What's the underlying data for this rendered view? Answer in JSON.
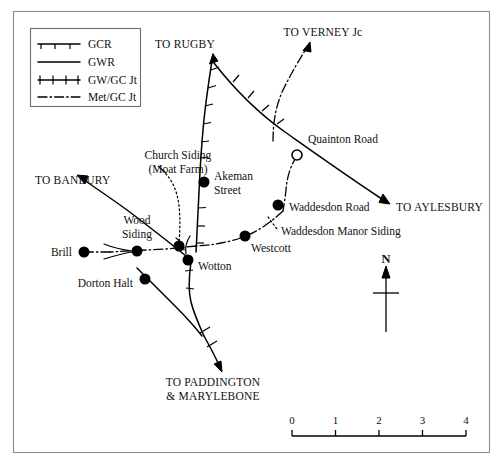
{
  "figure": {
    "kind": "railway-route-map",
    "region": "Brill Tramway / Great Central & Metropolitan lines, Buckinghamshire"
  },
  "legend": {
    "title": "",
    "items": [
      {
        "key": "gcr",
        "label": "GCR",
        "style": "solid-with-down-ticks"
      },
      {
        "key": "gwr",
        "label": "GWR",
        "style": "solid"
      },
      {
        "key": "gwgc",
        "label": "GW/GC Jt",
        "style": "solid-with-cross-ticks"
      },
      {
        "key": "metgc",
        "label": "Met/GC Jt",
        "style": "dash-dot"
      }
    ]
  },
  "destinations": [
    {
      "key": "rugby",
      "label": "TO RUGBY"
    },
    {
      "key": "verney",
      "label": "TO VERNEY Jc"
    },
    {
      "key": "aylesbury",
      "label": "TO AYLESBURY"
    },
    {
      "key": "banbury",
      "label": "TO BANBURY"
    },
    {
      "key": "paddington",
      "label_line1": "TO PADDINGTON",
      "label_line2": "& MARYLEBONE"
    }
  ],
  "stations": [
    {
      "key": "quainton",
      "label": "Quainton Road",
      "marker": "open-circle"
    },
    {
      "key": "akeman",
      "label_line1": "Akeman",
      "label_line2": "Street",
      "marker": "filled-circle"
    },
    {
      "key": "waddesdon_road",
      "label": "Waddesdon Road",
      "marker": "filled-circle"
    },
    {
      "key": "waddesdon_manor",
      "label": "Waddesdon Manor Siding",
      "marker": "none"
    },
    {
      "key": "westcott",
      "label": "Westcott",
      "marker": "filled-circle"
    },
    {
      "key": "wotton",
      "label": "Wotton",
      "marker": "filled-circle"
    },
    {
      "key": "wood_siding",
      "label_line1": "Wood",
      "label_line2": "Siding",
      "marker": "filled-circle"
    },
    {
      "key": "brill",
      "label": "Brill",
      "marker": "filled-circle"
    },
    {
      "key": "dorton_halt",
      "label": "Dorton Halt",
      "marker": "filled-circle"
    },
    {
      "key": "church_siding",
      "label_line1": "Church Siding",
      "label_line2": "(Moat Farm)",
      "marker": "none"
    }
  ],
  "north_arrow": {
    "label": "N"
  },
  "scale_bar": {
    "ticks": [
      "0",
      "1",
      "2",
      "3",
      "4"
    ],
    "min": 0,
    "max": 4
  },
  "colors": {
    "ink": "#000000",
    "frame": "#8c8c8c",
    "background": "#ffffff"
  }
}
